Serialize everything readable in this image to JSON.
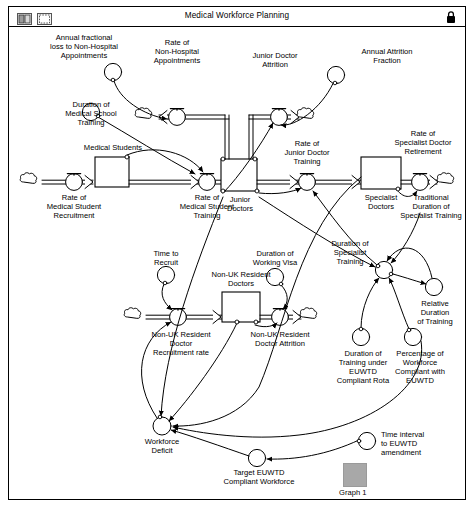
{
  "window": {
    "title": "Medical Workforce Planning",
    "toolbar_icons": [
      {
        "name": "two-pane-view-icon",
        "label": ""
      },
      {
        "name": "single-pane-view-icon",
        "label": ""
      }
    ],
    "lock_icon": "lock-icon"
  },
  "diagram": {
    "type": "system-dynamics-stock-and-flow",
    "stocks": [
      {
        "id": "medical-students",
        "label": "Medical Students",
        "x": 86,
        "y": 130,
        "w": 34,
        "h": 30
      },
      {
        "id": "junior-doctors",
        "label": "Junior\nDoctors",
        "x": 212,
        "y": 132,
        "w": 36,
        "h": 32
      },
      {
        "id": "specialist-doctors",
        "label": "Specialist\nDoctors",
        "x": 352,
        "y": 130,
        "w": 40,
        "h": 32
      },
      {
        "id": "non-uk-resident-doctors",
        "label": "Non-UK Resident\nDoctors",
        "x": 213,
        "y": 265,
        "w": 38,
        "h": 30
      }
    ],
    "flows": [
      {
        "id": "rate-of-medical-student-recruitment",
        "label": "Rate of\nMedical Student\nRecruitment"
      },
      {
        "id": "rate-of-medical-student-training",
        "label": "Rate of\nMedical Student\nTraining"
      },
      {
        "id": "rate-of-junior-doctor-training",
        "label": "Rate of\nJunior Doctor\nTraining"
      },
      {
        "id": "rate-of-specialist-doctor-retirement",
        "label": "Rate of\nSpecialist Doctor\nRetirement"
      },
      {
        "id": "rate-of-non-hospital-appointments",
        "label": "Rate of\nNon-Hospital\nAppointments"
      },
      {
        "id": "junior-doctor-attrition",
        "label": "Junior Doctor\nAttrition"
      },
      {
        "id": "non-uk-resident-doctor-recruitment-rate",
        "label": "Non-UK Resident\nDoctor\nRecruitment rate"
      },
      {
        "id": "non-uk-resident-doctor-attrition",
        "label": "Non-UK Resident\nDoctor Attrition"
      }
    ],
    "variables": [
      {
        "id": "annual-fractional-loss",
        "label": "Annual fractional\nloss to Non-Hospital\nAppointments"
      },
      {
        "id": "duration-of-medical-school-training",
        "label": "Duration of\nMedical School\nTraining"
      },
      {
        "id": "annual-attrition-fraction",
        "label": "Annual Attrition\nFraction"
      },
      {
        "id": "traditional-duration-of-specialist-training",
        "label": "Traditional\nDuration of\nSpecialist Training"
      },
      {
        "id": "time-to-recruit",
        "label": "Time to\nRecruit"
      },
      {
        "id": "duration-of-working-visa",
        "label": "Duration of\nWorking Visa"
      },
      {
        "id": "duration-of-specialist-training",
        "label": "Duration of\nSpecialist\nTraining"
      },
      {
        "id": "relative-duration-of-training",
        "label": "Relative\nDuration\nof Training"
      },
      {
        "id": "duration-of-training-under-euwtd",
        "label": "Duration of\nTraining under\nEUWTD\nCompliant Rota"
      },
      {
        "id": "percentage-of-workforce-compliant",
        "label": "Percentage of\nWorkforce\nCompliant with\nEUWTD"
      },
      {
        "id": "workforce-deficit",
        "label": "Workforce\nDeficit"
      },
      {
        "id": "target-euwtd-compliant-workforce",
        "label": "Target EUWTD\nCompliant Workforce"
      },
      {
        "id": "time-interval-to-euwtd-amendment",
        "label": "Time interval\nto EUWTD\namendment"
      }
    ],
    "graph_widget": {
      "label": "Graph 1"
    }
  },
  "colors": {
    "stroke": "#000000",
    "background": "#ffffff",
    "graph_thumb": "#a8a8a8"
  }
}
